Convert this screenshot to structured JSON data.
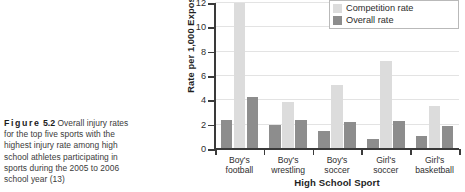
{
  "caption": {
    "figure_label": "Figure",
    "figure_number": "5.2",
    "lines": [
      "Overall injury rates",
      "for the top five sports with the",
      "highest injury rate among high",
      "school athletes participating in",
      "sports during the 2005 to 2006",
      "school year (13)"
    ]
  },
  "colors": {
    "competition_rate": "#dcdcdc",
    "overall_rate": "#8d8d8d",
    "axis": "#3a3a3a",
    "gridline": "#e3e3e3",
    "background": "#ffffff"
  },
  "chart_data": {
    "type": "bar",
    "title": "",
    "xlabel": "High School Sport",
    "ylabel": "Rate per 1,000 Exposures",
    "categories": [
      "Boy's football",
      "Boy's wrestling",
      "Boy's soccer",
      "Girl's soccer",
      "Girl's basketball"
    ],
    "category_lines": [
      [
        "Boy's",
        "football"
      ],
      [
        "Boy's",
        "wrestling"
      ],
      [
        "Boy's",
        "soccer"
      ],
      [
        "Girl's",
        "soccer"
      ],
      [
        "Girl's",
        "basketball"
      ]
    ],
    "series": [
      {
        "name": "Overall rate (left)",
        "key": "overall_left",
        "color": "#8d8d8d",
        "values": [
          2.4,
          2.0,
          1.5,
          0.8,
          1.1
        ]
      },
      {
        "name": "Competition rate",
        "key": "competition",
        "color": "#dcdcdc",
        "values": [
          12.0,
          3.9,
          5.25,
          7.25,
          3.5
        ]
      },
      {
        "name": "Overall rate (right)",
        "key": "overall_right",
        "color": "#8d8d8d",
        "values": [
          4.25,
          2.4,
          2.25,
          2.3,
          1.9
        ]
      }
    ],
    "ylim": [
      0,
      12
    ],
    "yticks": [
      0,
      2,
      4,
      6,
      8,
      10,
      12
    ],
    "ytick_labels": [
      "0",
      "2",
      "4",
      "6",
      "8",
      "10",
      "12"
    ],
    "grid": true,
    "legend_position": "top-right"
  },
  "legend": {
    "items": [
      {
        "label": "Competition rate",
        "color": "#dcdcdc"
      },
      {
        "label": "Overall rate",
        "color": "#8d8d8d"
      }
    ]
  }
}
